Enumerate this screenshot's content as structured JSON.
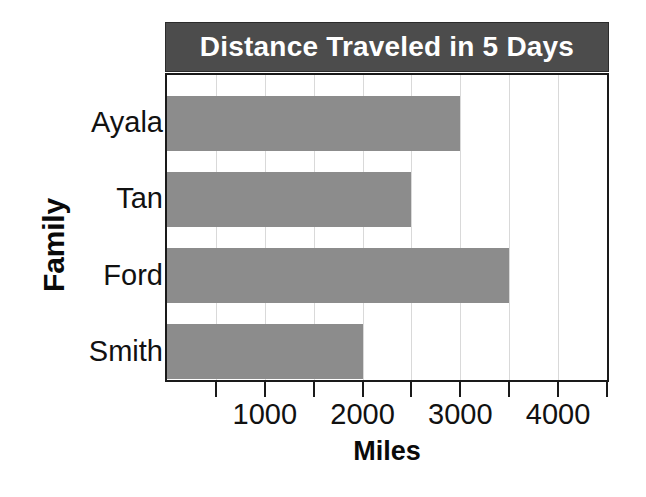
{
  "chart_data": {
    "type": "bar",
    "orientation": "horizontal",
    "title": "Distance Traveled in 5 Days",
    "xlabel": "Miles",
    "ylabel": "Family",
    "categories": [
      "Ayala",
      "Tan",
      "Ford",
      "Smith"
    ],
    "values": [
      3000,
      2500,
      3500,
      2000
    ],
    "xlim": [
      0,
      4500
    ],
    "xticks": [
      0,
      500,
      1000,
      1500,
      2000,
      2500,
      3000,
      3500,
      4000,
      4500
    ],
    "xtick_labels": [
      "1000",
      "2000",
      "3000",
      "4000"
    ],
    "xtick_label_values": [
      1000,
      2000,
      3000,
      4000
    ],
    "grid": true,
    "grid_axis": "x",
    "legend": false,
    "series": [
      {
        "name": "Distance Traveled in 5 Days",
        "values": [
          3000,
          2500,
          3500,
          2000
        ]
      }
    ]
  },
  "colors": {
    "bar_fill": "#8c8c8c",
    "title_bar_background": "#4c4c4c",
    "title_text": "#ffffff",
    "axis_line": "#1a1a1a",
    "gridline": "#d9d9d9",
    "plot_background": "#ffffff",
    "label_text": "#111111"
  }
}
